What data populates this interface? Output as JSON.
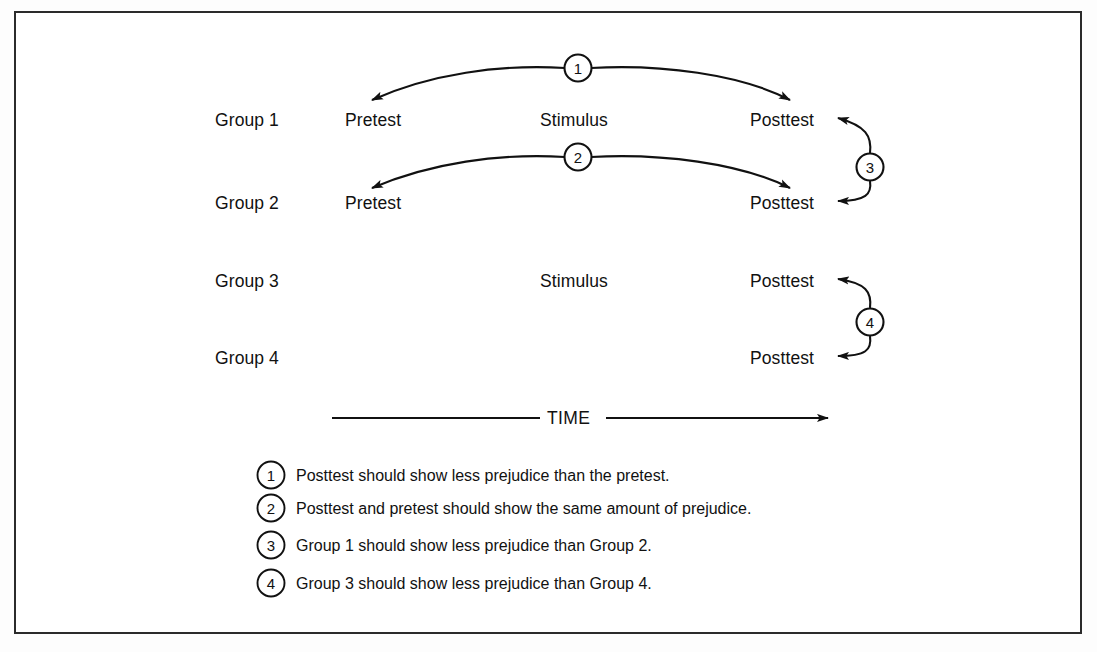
{
  "figure": {
    "frame_color": "#2b2b2b",
    "line_color": "#111111",
    "background": "#ffffff"
  },
  "time_axis": {
    "label": "TIME",
    "direction": "left-to-right"
  },
  "columns": [
    "Pretest",
    "Stimulus",
    "Posttest"
  ],
  "rows": [
    {
      "group": "Group 1",
      "pretest": "Pretest",
      "stimulus": "Stimulus",
      "posttest": "Posttest"
    },
    {
      "group": "Group 2",
      "pretest": "Pretest",
      "stimulus": "",
      "posttest": "Posttest"
    },
    {
      "group": "Group 3",
      "pretest": "",
      "stimulus": "Stimulus",
      "posttest": "Posttest"
    },
    {
      "group": "Group 4",
      "pretest": "",
      "stimulus": "",
      "posttest": "Posttest"
    }
  ],
  "markers": [
    {
      "number": "1",
      "comparison": "Group 1 pretest vs Group 1 posttest"
    },
    {
      "number": "2",
      "comparison": "Group 2 pretest vs Group 2 posttest"
    },
    {
      "number": "3",
      "comparison": "Group 1 posttest vs Group 2 posttest"
    },
    {
      "number": "4",
      "comparison": "Group 3 posttest vs Group 4 posttest"
    }
  ],
  "legend": [
    {
      "number": "1",
      "text": "Posttest should show less prejudice than the pretest."
    },
    {
      "number": "2",
      "text": "Posttest and pretest should show the same amount of prejudice."
    },
    {
      "number": "3",
      "text": "Group 1 should show less prejudice than Group 2."
    },
    {
      "number": "4",
      "text": "Group 3 should show less prejudice than Group 4."
    }
  ]
}
